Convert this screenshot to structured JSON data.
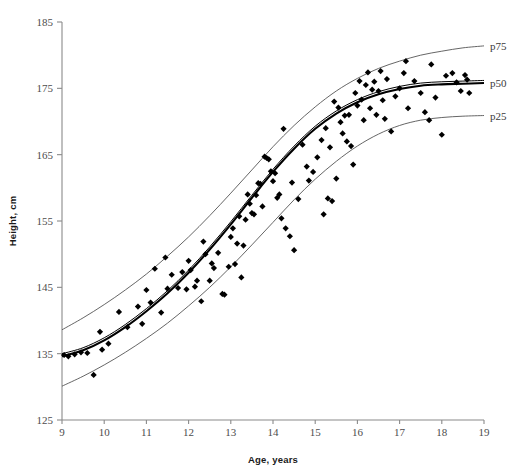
{
  "chart_data": {
    "type": "scatter",
    "title": "",
    "subtitle": "",
    "xlabel": "Age, years",
    "ylabel": "Height, cm",
    "xlim": [
      9,
      19
    ],
    "ylim": [
      125,
      185
    ],
    "xticks": [
      9,
      10,
      11,
      12,
      13,
      14,
      15,
      16,
      17,
      18,
      19
    ],
    "xtick_labels": [
      "9",
      "10",
      "11",
      "12",
      "13",
      "14",
      "15",
      "16",
      "17",
      "18",
      "19"
    ],
    "yticks": [
      125,
      135,
      145,
      155,
      165,
      175,
      185
    ],
    "ytick_labels": [
      "125",
      "135",
      "145",
      "155",
      "165",
      "175",
      "185"
    ],
    "grid": false,
    "legend_position": "right-inline",
    "annotations": [
      {
        "name": "p75",
        "text": "p75",
        "x": 19.0,
        "y": 181.4
      },
      {
        "name": "p50",
        "text": "p50",
        "x": 19.0,
        "y": 175.8
      },
      {
        "name": "p25",
        "text": "p25",
        "x": 19.0,
        "y": 170.9
      }
    ],
    "series": [
      {
        "name": "p75",
        "type": "line",
        "color": "#555555",
        "x": [
          9.0,
          9.5,
          10.0,
          10.5,
          11.0,
          11.5,
          12.0,
          12.5,
          13.0,
          13.5,
          14.0,
          14.5,
          15.0,
          15.5,
          16.0,
          16.5,
          17.0,
          17.5,
          18.0,
          18.5,
          19.0
        ],
        "values": [
          138.6,
          140.4,
          142.4,
          144.6,
          147.0,
          149.7,
          152.6,
          155.8,
          159.2,
          162.7,
          166.2,
          169.4,
          172.2,
          174.6,
          176.5,
          178.0,
          179.1,
          180.0,
          180.6,
          181.1,
          181.4
        ]
      },
      {
        "name": "p50",
        "type": "line",
        "color": "#000000",
        "x": [
          9.0,
          9.5,
          10.0,
          10.5,
          11.0,
          11.5,
          12.0,
          12.5,
          13.0,
          13.5,
          14.0,
          14.5,
          15.0,
          15.5,
          16.0,
          16.5,
          17.0,
          17.5,
          18.0,
          18.5,
          19.0
        ],
        "values": [
          134.6,
          135.5,
          137.0,
          139.0,
          141.4,
          144.1,
          147.2,
          150.7,
          154.5,
          158.5,
          162.4,
          165.9,
          168.9,
          171.2,
          172.9,
          174.1,
          174.9,
          175.4,
          175.6,
          175.7,
          175.8
        ]
      },
      {
        "name": "p25",
        "type": "line",
        "color": "#555555",
        "x": [
          9.0,
          9.5,
          10.0,
          10.5,
          11.0,
          11.5,
          12.0,
          12.5,
          13.0,
          13.5,
          14.0,
          14.5,
          15.0,
          15.5,
          16.0,
          16.5,
          17.0,
          17.5,
          18.0,
          18.5,
          19.0
        ],
        "values": [
          130.1,
          131.6,
          133.3,
          135.2,
          137.3,
          139.6,
          142.2,
          145.0,
          148.1,
          151.4,
          154.8,
          158.2,
          161.3,
          164.0,
          166.3,
          168.1,
          169.4,
          170.2,
          170.6,
          170.8,
          170.9
        ]
      },
      {
        "name": "observations",
        "type": "scatter",
        "color": "#000000",
        "points": [
          [
            9.05,
            134.8
          ],
          [
            9.15,
            134.6
          ],
          [
            9.3,
            134.9
          ],
          [
            9.45,
            135.2
          ],
          [
            9.6,
            135.1
          ],
          [
            9.75,
            131.8
          ],
          [
            9.9,
            138.3
          ],
          [
            10.1,
            136.5
          ],
          [
            10.35,
            141.3
          ],
          [
            10.55,
            139.0
          ],
          [
            10.8,
            142.1
          ],
          [
            11.0,
            144.6
          ],
          [
            11.1,
            142.7
          ],
          [
            11.2,
            147.8
          ],
          [
            11.35,
            141.2
          ],
          [
            11.5,
            144.8
          ],
          [
            11.6,
            146.9
          ],
          [
            11.75,
            144.9
          ],
          [
            11.85,
            147.3
          ],
          [
            11.95,
            144.7
          ],
          [
            12.0,
            149.0
          ],
          [
            12.05,
            147.6
          ],
          [
            12.15,
            145.1
          ],
          [
            12.2,
            146.0
          ],
          [
            12.35,
            151.9
          ],
          [
            12.4,
            150.0
          ],
          [
            12.5,
            146.0
          ],
          [
            12.55,
            148.6
          ],
          [
            12.6,
            147.9
          ],
          [
            12.7,
            150.2
          ],
          [
            12.8,
            144.0
          ],
          [
            12.85,
            143.9
          ],
          [
            12.95,
            148.1
          ],
          [
            13.0,
            152.6
          ],
          [
            13.05,
            153.9
          ],
          [
            13.15,
            151.6
          ],
          [
            13.2,
            155.7
          ],
          [
            13.3,
            151.3
          ],
          [
            13.35,
            155.2
          ],
          [
            13.4,
            159.0
          ],
          [
            13.45,
            157.6
          ],
          [
            13.5,
            156.2
          ],
          [
            13.55,
            156.0
          ],
          [
            13.6,
            158.9
          ],
          [
            13.65,
            160.7
          ],
          [
            13.7,
            160.6
          ],
          [
            13.75,
            157.2
          ],
          [
            13.8,
            164.7
          ],
          [
            13.85,
            164.5
          ],
          [
            13.9,
            164.3
          ],
          [
            13.95,
            162.5
          ],
          [
            14.0,
            161.0
          ],
          [
            14.05,
            162.2
          ],
          [
            14.1,
            158.5
          ],
          [
            14.15,
            159.0
          ],
          [
            14.2,
            155.4
          ],
          [
            14.3,
            153.9
          ],
          [
            14.4,
            152.7
          ],
          [
            14.5,
            150.6
          ],
          [
            14.6,
            158.3
          ],
          [
            14.7,
            166.5
          ],
          [
            14.8,
            163.2
          ],
          [
            14.85,
            161.1
          ],
          [
            14.95,
            162.4
          ],
          [
            15.05,
            164.6
          ],
          [
            15.15,
            167.2
          ],
          [
            15.2,
            156.0
          ],
          [
            15.25,
            169.0
          ],
          [
            15.3,
            158.4
          ],
          [
            15.35,
            166.1
          ],
          [
            15.4,
            158.0
          ],
          [
            15.5,
            161.4
          ],
          [
            15.55,
            172.1
          ],
          [
            15.6,
            169.9
          ],
          [
            15.65,
            168.2
          ],
          [
            15.7,
            170.9
          ],
          [
            15.75,
            167.0
          ],
          [
            15.8,
            171.0
          ],
          [
            15.85,
            166.3
          ],
          [
            15.9,
            163.5
          ],
          [
            15.95,
            174.3
          ],
          [
            16.0,
            172.4
          ],
          [
            16.05,
            176.1
          ],
          [
            16.1,
            173.3
          ],
          [
            16.15,
            170.2
          ],
          [
            16.2,
            175.5
          ],
          [
            16.25,
            177.4
          ],
          [
            16.3,
            172.0
          ],
          [
            16.35,
            174.8
          ],
          [
            16.4,
            176.0
          ],
          [
            16.45,
            171.0
          ],
          [
            16.5,
            174.6
          ],
          [
            16.55,
            177.6
          ],
          [
            16.6,
            173.2
          ],
          [
            16.65,
            170.4
          ],
          [
            16.7,
            176.4
          ],
          [
            16.8,
            168.5
          ],
          [
            16.9,
            173.8
          ],
          [
            17.0,
            175.0
          ],
          [
            17.1,
            177.3
          ],
          [
            17.2,
            172.0
          ],
          [
            17.35,
            176.1
          ],
          [
            17.5,
            174.3
          ],
          [
            17.6,
            171.4
          ],
          [
            17.7,
            170.2
          ],
          [
            17.75,
            178.6
          ],
          [
            17.85,
            173.6
          ],
          [
            18.0,
            168.0
          ],
          [
            18.1,
            176.9
          ],
          [
            18.25,
            177.3
          ],
          [
            18.35,
            175.9
          ],
          [
            18.45,
            174.6
          ],
          [
            18.55,
            177.0
          ],
          [
            18.6,
            176.3
          ],
          [
            18.65,
            174.3
          ],
          [
            14.25,
            168.9
          ],
          [
            13.1,
            148.5
          ],
          [
            12.3,
            142.9
          ],
          [
            10.9,
            139.5
          ],
          [
            9.95,
            135.6
          ],
          [
            11.45,
            149.5
          ],
          [
            13.25,
            146.5
          ],
          [
            14.45,
            160.8
          ],
          [
            15.45,
            173.0
          ],
          [
            17.15,
            179.1
          ]
        ]
      }
    ]
  },
  "axes": {
    "x_axis_name": "age-axis",
    "y_axis_name": "height-axis"
  }
}
